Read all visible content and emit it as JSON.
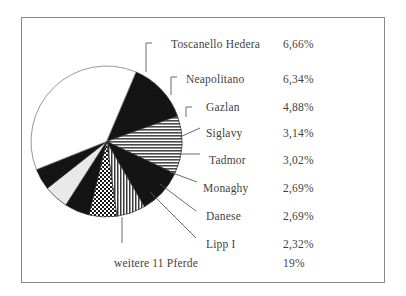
{
  "figure": {
    "border_color": "#8a8a8a",
    "background": "#ffffff"
  },
  "chart_data": {
    "type": "pie",
    "title": "",
    "subtitle": "",
    "xlabel": "",
    "ylabel": "",
    "legend_position": "right",
    "grid": false,
    "units": "percent",
    "decimal_separator": ",",
    "categories": [
      "Toscanello Hedera",
      "Neapolitano",
      "Gazlan",
      "Siglavy",
      "Tadmor",
      "Monaghy",
      "Danese",
      "Lipp I",
      "weitere 11 Pferde"
    ],
    "values": [
      6.66,
      6.34,
      4.88,
      3.14,
      3.02,
      2.69,
      2.69,
      2.32,
      19
    ],
    "value_labels": [
      "6,66%",
      "6,34%",
      "4,88%",
      "3,14%",
      "3,02%",
      "2,69%",
      "2,69%",
      "2,32%",
      "19%"
    ],
    "slice_fills": [
      "solid-black",
      "horizontal-stripes",
      "solid-black",
      "vertical-stripes",
      "checkerboard",
      "solid-black",
      "light-gray",
      "solid-black",
      "white"
    ],
    "start_angle_deg": -67,
    "direction": "clockwise"
  },
  "legend": {
    "items": [
      {
        "label": "Toscanello Hedera",
        "value": "6,66%"
      },
      {
        "label": "Neapolitano",
        "value": "6,34%"
      },
      {
        "label": "Gazlan",
        "value": "4,88%"
      },
      {
        "label": "Siglavy",
        "value": "3,14%"
      },
      {
        "label": "Tadmor",
        "value": "3,02%"
      },
      {
        "label": "Monaghy",
        "value": "2,69%"
      },
      {
        "label": "Danese",
        "value": "2,69%"
      },
      {
        "label": "Lipp I",
        "value": "2,32%"
      },
      {
        "label": "weitere 11 Pferde",
        "value": "19%"
      }
    ]
  }
}
